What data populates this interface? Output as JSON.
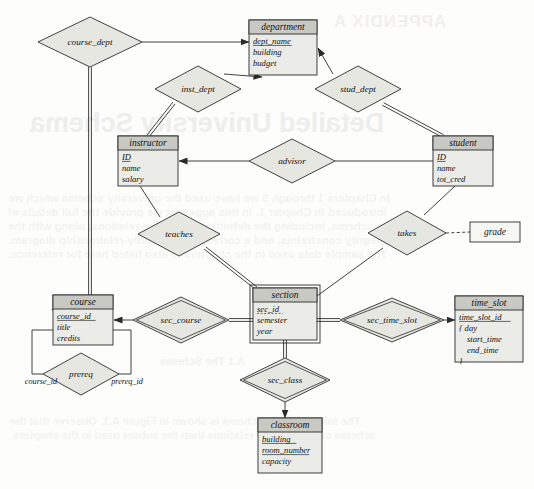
{
  "diagram": {
    "type": "er-diagram",
    "title": "Detailed University Schema",
    "background_text": {
      "appendix": "APPENDIX A",
      "heading": "Detailed University Schema",
      "subheading": "A.1  The Schema",
      "body_lines": [
        "In Chapters 1 through 5 we have used the university schema which we",
        "introduced in Chapter 1. In this appendix we provide the full details of",
        "the schema, including the definitions of all the relations, along with the",
        "integrity constraints, and a corresponding entity-relationship diagram.",
        "The sample data used in the chapters is also listed here for reference.",
        "The full university schema is shown in Figure A.1. Observe that the",
        "schema contains more relations than the subset used in the chapters."
      ]
    },
    "entities": [
      {
        "id": "department",
        "name": "department",
        "weak": false,
        "x": 249,
        "y": 20,
        "w": 68,
        "h": 55,
        "attributes": [
          {
            "name": "dept_name",
            "key": "primary"
          },
          {
            "name": "building",
            "key": "none"
          },
          {
            "name": "budget",
            "key": "none"
          }
        ]
      },
      {
        "id": "instructor",
        "name": "instructor",
        "weak": false,
        "x": 118,
        "y": 136,
        "w": 60,
        "h": 50,
        "attributes": [
          {
            "name": "ID",
            "key": "primary"
          },
          {
            "name": "name",
            "key": "none"
          },
          {
            "name": "salary",
            "key": "none"
          }
        ]
      },
      {
        "id": "student",
        "name": "student",
        "weak": false,
        "x": 433,
        "y": 136,
        "w": 60,
        "h": 50,
        "attributes": [
          {
            "name": "ID",
            "key": "primary"
          },
          {
            "name": "name",
            "key": "none"
          },
          {
            "name": "tot_cred",
            "key": "none"
          }
        ]
      },
      {
        "id": "course",
        "name": "course",
        "weak": false,
        "x": 53,
        "y": 295,
        "w": 60,
        "h": 50,
        "attributes": [
          {
            "name": "course_id",
            "key": "primary"
          },
          {
            "name": "title",
            "key": "none"
          },
          {
            "name": "credits",
            "key": "none"
          }
        ]
      },
      {
        "id": "section",
        "name": "section",
        "weak": true,
        "x": 253,
        "y": 288,
        "w": 64,
        "h": 52,
        "attributes": [
          {
            "name": "sec_id",
            "key": "discriminator"
          },
          {
            "name": "semester",
            "key": "none"
          },
          {
            "name": "year",
            "key": "none"
          }
        ]
      },
      {
        "id": "time_slot",
        "name": "time_slot",
        "weak": false,
        "x": 455,
        "y": 296,
        "w": 68,
        "h": 66,
        "attributes": [
          {
            "name": "time_slot_id",
            "key": "primary"
          },
          {
            "name": "{ day",
            "key": "none"
          },
          {
            "name": "start_time",
            "key": "none",
            "indent": true
          },
          {
            "name": "end_time",
            "key": "none",
            "indent": true
          },
          {
            "name": "}",
            "key": "none"
          }
        ]
      },
      {
        "id": "classroom",
        "name": "classroom",
        "weak": false,
        "x": 258,
        "y": 418,
        "w": 64,
        "h": 55,
        "attributes": [
          {
            "name": "building",
            "key": "primary"
          },
          {
            "name": "room_number",
            "key": "primary"
          },
          {
            "name": "capacity",
            "key": "none"
          }
        ]
      }
    ],
    "relationships": [
      {
        "id": "course_dept",
        "name": "course_dept",
        "x": 90,
        "y": 42,
        "rx": 52,
        "ry": 25,
        "identifying": false
      },
      {
        "id": "inst_dept",
        "name": "inst_dept",
        "x": 198,
        "y": 89,
        "rx": 43,
        "ry": 23,
        "identifying": false
      },
      {
        "id": "stud_dept",
        "name": "stud_dept",
        "x": 358,
        "y": 89,
        "rx": 43,
        "ry": 23,
        "identifying": false
      },
      {
        "id": "advisor",
        "name": "advisor",
        "x": 292,
        "y": 161,
        "rx": 43,
        "ry": 22,
        "identifying": false
      },
      {
        "id": "teaches",
        "name": "teaches",
        "x": 179,
        "y": 234,
        "rx": 41,
        "ry": 22,
        "identifying": false
      },
      {
        "id": "takes",
        "name": "takes",
        "x": 407,
        "y": 233,
        "rx": 39,
        "ry": 22,
        "identifying": false
      },
      {
        "id": "sec_course",
        "name": "sec_course",
        "x": 181,
        "y": 320,
        "rx": 48,
        "ry": 23,
        "identifying": true
      },
      {
        "id": "sec_time_slot",
        "name": "sec_time_slot",
        "x": 392,
        "y": 320,
        "rx": 52,
        "ry": 22,
        "identifying": true
      },
      {
        "id": "sec_class",
        "name": "sec_class",
        "x": 285,
        "y": 380,
        "rx": 45,
        "ry": 22,
        "identifying": true
      },
      {
        "id": "prereq",
        "name": "prereq",
        "x": 81,
        "y": 374,
        "rx": 38,
        "ry": 21,
        "identifying": false
      }
    ],
    "descriptive_attributes": [
      {
        "id": "grade",
        "name": "grade",
        "x": 470,
        "y": 222,
        "w": 50,
        "h": 20,
        "attached_to": "takes"
      }
    ],
    "role_labels": [
      {
        "id": "prereq-role-course-id",
        "text": "course_id",
        "x": 41,
        "y": 384
      },
      {
        "id": "prereq-role-prereq-id",
        "text": "prereq_id",
        "x": 127,
        "y": 384
      }
    ],
    "edges": [
      {
        "id": "course_dept-department",
        "from": "course_dept",
        "to": "department",
        "style": "arrow"
      },
      {
        "id": "course_dept-course",
        "from": "course_dept",
        "to": "course",
        "style": "double"
      },
      {
        "id": "inst_dept-department",
        "from": "inst_dept",
        "to": "department",
        "style": "arrow"
      },
      {
        "id": "inst_dept-instructor",
        "from": "inst_dept",
        "to": "instructor",
        "style": "double"
      },
      {
        "id": "stud_dept-department",
        "from": "stud_dept",
        "to": "department",
        "style": "arrow"
      },
      {
        "id": "stud_dept-student",
        "from": "stud_dept",
        "to": "student",
        "style": "double"
      },
      {
        "id": "advisor-instructor",
        "from": "advisor",
        "to": "instructor",
        "style": "arrow"
      },
      {
        "id": "advisor-student",
        "from": "advisor",
        "to": "student",
        "style": "plain"
      },
      {
        "id": "teaches-instructor",
        "from": "teaches",
        "to": "instructor",
        "style": "plain"
      },
      {
        "id": "teaches-section",
        "from": "teaches",
        "to": "section",
        "style": "double"
      },
      {
        "id": "takes-student",
        "from": "takes",
        "to": "student",
        "style": "plain"
      },
      {
        "id": "takes-section",
        "from": "takes",
        "to": "section",
        "style": "plain"
      },
      {
        "id": "takes-grade",
        "from": "takes",
        "to": "grade",
        "style": "dashed"
      },
      {
        "id": "sec_course-course",
        "from": "sec_course",
        "to": "course",
        "style": "arrow"
      },
      {
        "id": "sec_course-section",
        "from": "sec_course",
        "to": "section",
        "style": "double"
      },
      {
        "id": "sec_time_slot-time_slot",
        "from": "sec_time_slot",
        "to": "time_slot",
        "style": "arrow"
      },
      {
        "id": "sec_time_slot-section",
        "from": "sec_time_slot",
        "to": "section",
        "style": "double"
      },
      {
        "id": "sec_class-section",
        "from": "sec_class",
        "to": "section",
        "style": "double"
      },
      {
        "id": "sec_class-classroom",
        "from": "sec_class",
        "to": "classroom",
        "style": "arrow"
      },
      {
        "id": "prereq-course-left",
        "from": "prereq",
        "to": "course",
        "style": "plain"
      },
      {
        "id": "prereq-course-right",
        "from": "prereq",
        "to": "course",
        "style": "plain"
      }
    ],
    "colors": {
      "entity_header_fill": "#c9c9c4",
      "entity_body_fill": "#ebebe7",
      "relationship_fill": "#e7e7e2",
      "line": "#2b2b2b",
      "page_bg": "#fdfdfc"
    }
  }
}
